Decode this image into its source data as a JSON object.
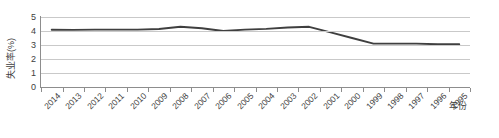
{
  "chart_data": {
    "type": "line",
    "title": "",
    "xlabel": "年份",
    "ylabel": "失业率(%)",
    "ylim": [
      0,
      5
    ],
    "yticks": [
      0,
      1,
      2,
      3,
      4,
      5
    ],
    "grid": true,
    "legend": "none",
    "x_axis_reversed": true,
    "categories": [
      "2014",
      "2013",
      "2012",
      "2011",
      "2010",
      "2009",
      "2008",
      "2007",
      "2006",
      "2005",
      "2004",
      "2003",
      "2002",
      "2001",
      "2000",
      "1999",
      "1998",
      "1997",
      "1996",
      "1995"
    ],
    "values": [
      4.09,
      4.08,
      4.1,
      4.1,
      4.1,
      4.14,
      4.3,
      4.2,
      4.0,
      4.1,
      4.15,
      4.25,
      4.3,
      3.9,
      3.5,
      3.1,
      3.1,
      3.1,
      3.1,
      3.05
    ],
    "series": [
      {
        "name": "失业率(%)",
        "color": "#3f3f3f",
        "values": [
          4.09,
          4.08,
          4.1,
          4.1,
          4.1,
          4.14,
          4.3,
          4.2,
          4.0,
          4.1,
          4.15,
          4.25,
          4.3,
          3.9,
          3.5,
          3.1,
          3.1,
          3.1,
          3.05,
          3.05
        ]
      }
    ]
  },
  "axes": {
    "y_title": "失业率(%)",
    "x_title": "年份",
    "y_tick_labels": [
      "5",
      "4",
      "3",
      "2",
      "1",
      "0"
    ],
    "x_tick_labels": [
      "2014",
      "2013",
      "2012",
      "2011",
      "2010",
      "2009",
      "2008",
      "2007",
      "2006",
      "2005",
      "2004",
      "2003",
      "2002",
      "2001",
      "2000",
      "1999",
      "1998",
      "1997",
      "1996",
      "1995"
    ]
  },
  "colors": {
    "line": "#3f3f3f",
    "grid": "#c9c9c9",
    "axis": "#8d8d8d",
    "text": "#404040",
    "background": "#ffffff"
  }
}
